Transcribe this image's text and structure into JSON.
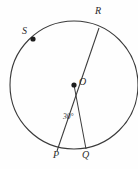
{
  "figure": {
    "type": "circle-geometry-diagram",
    "background_color": "#fefefe",
    "stroke_color": "#3a3a3a",
    "label_color": "#2b2b2b",
    "width": 138,
    "height": 169
  },
  "circle": {
    "center_label": "O",
    "center_x": 74,
    "center_y": 85,
    "radius": 64
  },
  "points": [
    {
      "label": "R",
      "x": 99,
      "y": 28,
      "label_x": 95,
      "label_y": 8,
      "marked_dot": false
    },
    {
      "label": "S",
      "x": 33,
      "y": 39,
      "label_x": 22,
      "label_y": 28,
      "marked_dot": true
    },
    {
      "label": "O",
      "x": 74,
      "y": 85,
      "label_x": 79,
      "label_y": 79,
      "marked_dot": true
    },
    {
      "label": "P",
      "x": 57,
      "y": 151,
      "label_x": 53,
      "label_y": 152,
      "marked_dot": false
    },
    {
      "label": "Q",
      "x": 86,
      "y": 149,
      "label_x": 82,
      "label_y": 152,
      "marked_dot": false
    }
  ],
  "segments": [
    {
      "name": "segment-RP",
      "from": "R",
      "to": "P"
    },
    {
      "name": "segment-OQ",
      "from": "O",
      "to": "Q"
    }
  ],
  "angles": [
    {
      "name": "angle-POQ",
      "value": "30°",
      "vertex": "O",
      "label_x": 63,
      "label_y": 114
    }
  ]
}
